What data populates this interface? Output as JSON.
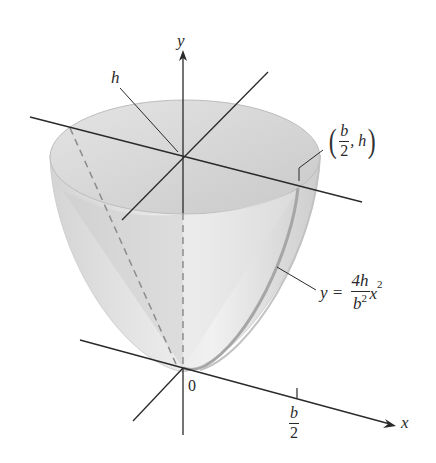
{
  "figure": {
    "colors": {
      "axis": "#2a2a2a",
      "surface_light": "#ececec",
      "surface_mid": "#d6d6d6",
      "surface_dark": "#c4c4c4",
      "rim": "#b8b8b8",
      "dashed": "#8a8a8a"
    }
  },
  "labels": {
    "y_axis": "y",
    "x_axis": "x",
    "origin": "0",
    "height": "h",
    "tick_num": "b",
    "tick_den": "2",
    "point": {
      "open": "(",
      "num": "b",
      "den": "2",
      "sep": ", h",
      "close": ")"
    },
    "equation": {
      "lhs": "y =",
      "num": "4h",
      "den_base": "b",
      "den_exp": "2",
      "var": "x",
      "var_exp": "2"
    }
  }
}
